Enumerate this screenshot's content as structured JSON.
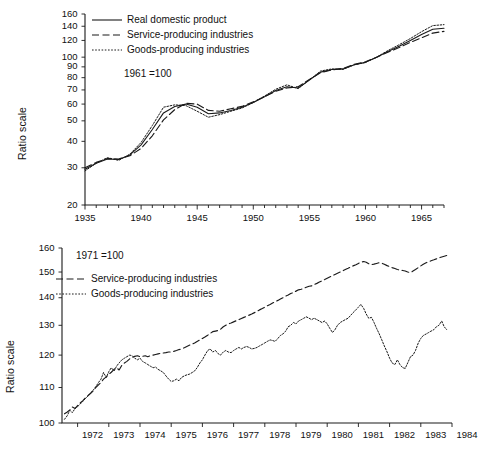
{
  "figure": {
    "background_color": "#ffffff",
    "line_color": "#1a1a1a"
  },
  "chart_data": [
    {
      "id": "top",
      "type": "line",
      "title": "",
      "subtitle": "",
      "xlabel": "",
      "ylabel": "Ratio scale",
      "annotation": "1961 =100",
      "yscale": "log",
      "ylim": [
        20,
        160
      ],
      "ytick_labels": [
        "20",
        "30",
        "40",
        "50",
        "60",
        "70",
        "80",
        "90",
        "100",
        "120",
        "140",
        "160"
      ],
      "ytick_values": [
        20,
        30,
        40,
        50,
        60,
        70,
        80,
        90,
        100,
        120,
        140,
        160
      ],
      "xlim": [
        1935,
        1967
      ],
      "xtick_labels": [
        "1935",
        "1940",
        "1945",
        "1950",
        "1955",
        "1960",
        "1965"
      ],
      "xtick_values": [
        1935,
        1940,
        1945,
        1950,
        1955,
        1960,
        1965
      ],
      "xminor_step": 1,
      "grid": false,
      "legend_position": "upper left",
      "x": [
        1935,
        1936,
        1937,
        1938,
        1939,
        1940,
        1941,
        1942,
        1943,
        1944,
        1945,
        1946,
        1947,
        1948,
        1949,
        1950,
        1951,
        1952,
        1953,
        1954,
        1955,
        1956,
        1957,
        1958,
        1959,
        1960,
        1961,
        1962,
        1963,
        1964,
        1965,
        1966,
        1967
      ],
      "series": [
        {
          "name": "Real domestic product",
          "style": "solid",
          "values": [
            29.5,
            31.5,
            33.0,
            32.8,
            34.5,
            38.5,
            45.5,
            54.5,
            58.5,
            60.0,
            58.0,
            54.0,
            54.5,
            56.0,
            58.0,
            61.0,
            65.0,
            69.5,
            72.5,
            71.5,
            78.0,
            85.0,
            87.5,
            88.0,
            92.0,
            94.5,
            100.0,
            106.5,
            112.5,
            120.0,
            128.0,
            135.5,
            137.0
          ]
        },
        {
          "name": "Service-producing industries",
          "style": "dashed",
          "values": [
            30.0,
            31.8,
            33.2,
            33.0,
            34.2,
            37.0,
            42.5,
            50.5,
            56.5,
            60.5,
            60.0,
            56.0,
            55.5,
            57.0,
            58.5,
            61.5,
            65.0,
            69.0,
            71.5,
            72.5,
            78.5,
            84.5,
            87.0,
            88.5,
            92.5,
            95.0,
            100.0,
            105.5,
            111.0,
            117.5,
            123.5,
            130.0,
            132.5
          ]
        },
        {
          "name": "Goods-producing industries",
          "style": "dotted",
          "values": [
            29.0,
            31.5,
            33.5,
            32.5,
            34.8,
            39.5,
            47.5,
            58.0,
            59.5,
            59.0,
            55.5,
            52.0,
            53.5,
            55.5,
            57.5,
            61.0,
            65.5,
            70.5,
            74.0,
            71.0,
            78.0,
            86.0,
            88.0,
            87.5,
            92.0,
            94.5,
            100.0,
            107.5,
            114.5,
            122.5,
            132.0,
            141.0,
            142.5
          ]
        }
      ]
    },
    {
      "id": "bottom",
      "type": "line",
      "title": "",
      "subtitle": "",
      "xlabel": "",
      "ylabel": "Ratio scale",
      "annotation": "1971 =100",
      "yscale": "log",
      "ylim": [
        100,
        160
      ],
      "ytick_labels": [
        "100",
        "110",
        "120",
        "130",
        "140",
        "150",
        "160"
      ],
      "ytick_values": [
        100,
        110,
        120,
        130,
        140,
        150,
        160
      ],
      "xlim": [
        1971.5,
        1984.0
      ],
      "xtick_labels": [
        "1972",
        "1973",
        "1974",
        "1975",
        "1976",
        "1977",
        "1978",
        "1979",
        "1980",
        "1981",
        "1982",
        "1983",
        "1984"
      ],
      "xtick_values": [
        1972,
        1973,
        1974,
        1975,
        1976,
        1977,
        1978,
        1979,
        1980,
        1981,
        1982,
        1983,
        1984
      ],
      "grid": false,
      "legend_position": "upper left",
      "x": [
        1971.58,
        1971.67,
        1971.75,
        1971.83,
        1971.92,
        1972.0,
        1972.08,
        1972.17,
        1972.25,
        1972.33,
        1972.42,
        1972.5,
        1972.58,
        1972.67,
        1972.75,
        1972.83,
        1972.92,
        1973.0,
        1973.08,
        1973.17,
        1973.25,
        1973.33,
        1973.42,
        1973.5,
        1973.58,
        1973.67,
        1973.75,
        1973.83,
        1973.92,
        1974.0,
        1974.08,
        1974.17,
        1974.25,
        1974.33,
        1974.42,
        1974.5,
        1974.58,
        1974.67,
        1974.75,
        1974.83,
        1974.92,
        1975.0,
        1975.08,
        1975.17,
        1975.25,
        1975.33,
        1975.42,
        1975.5,
        1975.58,
        1975.67,
        1975.75,
        1975.83,
        1975.92,
        1976.0,
        1976.08,
        1976.17,
        1976.25,
        1976.33,
        1976.42,
        1976.5,
        1976.58,
        1976.67,
        1976.75,
        1976.83,
        1976.92,
        1977.0,
        1977.08,
        1977.17,
        1977.25,
        1977.33,
        1977.42,
        1977.5,
        1977.58,
        1977.67,
        1977.75,
        1977.83,
        1977.92,
        1978.0,
        1978.08,
        1978.17,
        1978.25,
        1978.33,
        1978.42,
        1978.5,
        1978.58,
        1978.67,
        1978.75,
        1978.83,
        1978.92,
        1979.0,
        1979.08,
        1979.17,
        1979.25,
        1979.33,
        1979.42,
        1979.5,
        1979.58,
        1979.67,
        1979.75,
        1979.83,
        1979.92,
        1980.0,
        1980.08,
        1980.17,
        1980.25,
        1980.33,
        1980.42,
        1980.5,
        1980.58,
        1980.67,
        1980.75,
        1980.83,
        1980.92,
        1981.0,
        1981.08,
        1981.17,
        1981.25,
        1981.33,
        1981.42,
        1981.5,
        1981.58,
        1981.67,
        1981.75,
        1981.83,
        1981.92,
        1982.0,
        1982.08,
        1982.17,
        1982.25,
        1982.33,
        1982.42,
        1982.5,
        1982.58,
        1982.67,
        1982.75,
        1982.83,
        1982.92,
        1983.0,
        1983.08,
        1983.17,
        1983.25,
        1983.33,
        1983.42,
        1983.5,
        1983.58,
        1983.67,
        1983.75,
        1983.83,
        1983.92
      ],
      "series": [
        {
          "name": "Service-producing industries",
          "style": "dashed",
          "values": [
            102.5,
            103.0,
            103.6,
            104.4,
            104.0,
            104.8,
            105.5,
            106.2,
            107.0,
            107.6,
            108.3,
            109.0,
            110.0,
            110.8,
            111.5,
            112.5,
            113.2,
            114.0,
            114.6,
            115.5,
            116.0,
            115.3,
            116.8,
            117.5,
            118.0,
            118.8,
            119.2,
            119.6,
            119.8,
            119.5,
            119.6,
            119.8,
            119.5,
            119.8,
            120.0,
            120.2,
            120.4,
            120.6,
            120.7,
            120.8,
            121.0,
            121.0,
            121.2,
            121.5,
            121.8,
            122.0,
            122.4,
            122.8,
            123.2,
            123.6,
            124.0,
            124.5,
            125.0,
            125.5,
            126.0,
            126.6,
            127.2,
            127.8,
            128.0,
            128.2,
            128.6,
            129.5,
            130.0,
            130.5,
            130.8,
            131.2,
            131.6,
            132.0,
            132.4,
            132.8,
            133.2,
            133.6,
            134.0,
            134.5,
            135.0,
            135.5,
            136.0,
            136.5,
            137.0,
            137.5,
            138.0,
            138.5,
            139.0,
            139.5,
            140.0,
            140.6,
            141.0,
            141.6,
            142.0,
            142.5,
            143.0,
            143.2,
            143.6,
            144.0,
            144.4,
            144.5,
            145.0,
            145.5,
            146.0,
            146.5,
            147.0,
            147.5,
            148.0,
            148.5,
            149.0,
            149.5,
            150.0,
            150.5,
            151.0,
            151.5,
            152.0,
            152.5,
            153.0,
            153.5,
            154.0,
            154.3,
            154.0,
            153.4,
            153.0,
            153.2,
            153.5,
            153.8,
            153.6,
            153.2,
            152.6,
            152.2,
            151.8,
            151.4,
            151.0,
            150.8,
            150.6,
            150.4,
            150.0,
            149.8,
            150.4,
            151.0,
            151.8,
            152.5,
            153.2,
            153.8,
            154.2,
            154.6,
            155.0,
            155.4,
            155.8,
            156.2,
            156.5,
            156.8,
            157.0
          ]
        },
        {
          "name": "Goods-producing industries",
          "style": "dotted",
          "values": [
            101.0,
            102.0,
            103.5,
            102.8,
            104.0,
            104.5,
            105.2,
            106.0,
            106.8,
            107.5,
            108.5,
            109.2,
            110.2,
            111.5,
            112.5,
            114.5,
            113.0,
            114.8,
            116.0,
            115.0,
            116.5,
            117.5,
            118.5,
            119.0,
            119.5,
            120.0,
            119.8,
            119.0,
            118.5,
            119.0,
            118.0,
            117.5,
            117.0,
            116.5,
            116.0,
            116.2,
            115.5,
            115.0,
            114.5,
            113.5,
            112.5,
            111.8,
            112.0,
            112.5,
            112.0,
            113.0,
            113.5,
            113.8,
            114.0,
            114.5,
            115.0,
            116.0,
            117.5,
            118.5,
            120.0,
            121.5,
            122.0,
            121.0,
            121.5,
            120.5,
            120.0,
            121.0,
            121.5,
            121.0,
            120.8,
            121.5,
            122.0,
            122.5,
            122.0,
            122.5,
            122.8,
            122.5,
            122.0,
            122.2,
            122.5,
            123.0,
            123.5,
            124.0,
            124.5,
            125.0,
            124.8,
            124.5,
            125.5,
            126.5,
            127.0,
            128.0,
            129.5,
            130.0,
            131.0,
            130.5,
            131.5,
            132.0,
            132.5,
            133.0,
            132.5,
            132.0,
            132.5,
            132.0,
            131.5,
            131.0,
            131.5,
            130.5,
            129.0,
            127.5,
            128.5,
            130.0,
            131.0,
            131.5,
            132.0,
            132.5,
            133.5,
            134.5,
            135.5,
            136.5,
            137.5,
            136.0,
            134.0,
            132.5,
            132.8,
            131.0,
            129.0,
            127.0,
            125.0,
            123.0,
            121.0,
            119.0,
            117.5,
            117.0,
            118.5,
            117.0,
            116.0,
            115.8,
            117.5,
            119.5,
            120.0,
            121.5,
            124.0,
            125.5,
            126.5,
            127.0,
            127.5,
            128.0,
            128.5,
            129.5,
            130.0,
            131.5,
            129.5,
            128.5
          ]
        }
      ]
    }
  ],
  "panels": {
    "top": {
      "ylabel": "Ratio scale",
      "base_note": "1961 =100",
      "legend": [
        {
          "label": "Real domestic product",
          "style": "solid"
        },
        {
          "label": "Service-producing industries",
          "style": "dashed"
        },
        {
          "label": "Goods-producing industries",
          "style": "dotted"
        }
      ],
      "ytick_labels": [
        "160",
        "140",
        "120",
        "100",
        "90",
        "80",
        "70",
        "60",
        "50",
        "40",
        "30",
        "20"
      ],
      "xtick_labels": [
        "1935",
        "1940",
        "1945",
        "1950",
        "1955",
        "1960",
        "1965"
      ]
    },
    "bottom": {
      "ylabel": "Ratio scale",
      "base_note": "1971 =100",
      "legend": [
        {
          "label": "Service-producing industries",
          "style": "dashed"
        },
        {
          "label": "Goods-producing industries",
          "style": "dotted"
        }
      ],
      "ytick_labels": [
        "160",
        "150",
        "140",
        "130",
        "120",
        "110",
        "100"
      ],
      "xtick_labels": [
        "1972",
        "1973",
        "1974",
        "1975",
        "1976",
        "1977",
        "1978",
        "1979",
        "1980",
        "1981",
        "1982",
        "1983",
        "1984"
      ]
    }
  }
}
